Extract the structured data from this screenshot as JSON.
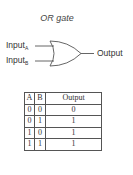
{
  "diagram": {
    "title": "OR gate",
    "inputs": [
      {
        "label": "Input",
        "subscript": "A"
      },
      {
        "label": "Input",
        "subscript": "B"
      }
    ],
    "output_label": "Output",
    "gate_type": "OR",
    "line_color": "#555555"
  },
  "truth_table": {
    "headers": [
      "A",
      "B",
      "Output"
    ],
    "rows": [
      [
        "0",
        "0",
        "0"
      ],
      [
        "0",
        "1",
        "1"
      ],
      [
        "1",
        "0",
        "1"
      ],
      [
        "1",
        "1",
        "1"
      ]
    ]
  }
}
